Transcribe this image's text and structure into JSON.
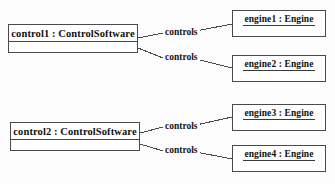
{
  "diagram": {
    "type": "uml-object-diagram",
    "background_color": "#fdfdfd",
    "line_color": "#4a4a4a",
    "text_color": "#111111"
  },
  "objects": [
    {
      "id": "control1",
      "name": "control1 : ControlSoftware",
      "instance": "control1",
      "classifier": "ControlSoftware",
      "compartments": 2
    },
    {
      "id": "control2",
      "name": "control2 : ControlSoftware",
      "instance": "control2",
      "classifier": "ControlSoftware",
      "compartments": 2
    },
    {
      "id": "engine1",
      "name": "engine1 : Engine",
      "instance": "engine1",
      "classifier": "Engine",
      "compartments": 2
    },
    {
      "id": "engine2",
      "name": "engine2 : Engine",
      "instance": "engine2",
      "classifier": "Engine",
      "compartments": 2
    },
    {
      "id": "engine3",
      "name": "engine3 : Engine",
      "instance": "engine3",
      "classifier": "Engine",
      "compartments": 2
    },
    {
      "id": "engine4",
      "name": "engine4 : Engine",
      "instance": "engine4",
      "classifier": "Engine",
      "compartments": 2
    }
  ],
  "links": [
    {
      "id": "c1e1",
      "from": "control1",
      "to": "engine1",
      "label": "controls"
    },
    {
      "id": "c1e2",
      "from": "control1",
      "to": "engine2",
      "label": "controls"
    },
    {
      "id": "c2e3",
      "from": "control2",
      "to": "engine3",
      "label": "controls"
    },
    {
      "id": "c2e4",
      "from": "control2",
      "to": "engine4",
      "label": "controls"
    }
  ]
}
